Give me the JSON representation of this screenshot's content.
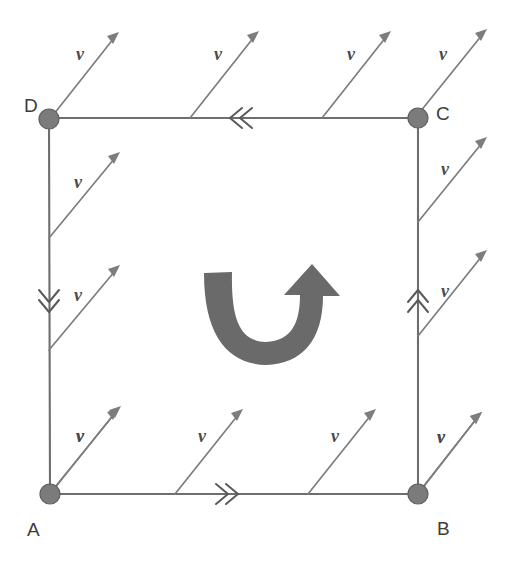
{
  "figure": {
    "shape": "square-loop",
    "background_color": "#ffffff",
    "line_color": "#6e6e6e",
    "vector_color": "#7d7d7d",
    "node_color": "#7b7b7b",
    "curved_arrow_color": "#6a6a6a",
    "label_color": "#3c3c3c"
  },
  "nodes": [
    {
      "id": "D",
      "label": "D",
      "x": 49,
      "y": 119,
      "label_x": 24,
      "label_y": 105,
      "radius": 10
    },
    {
      "id": "C",
      "label": "C",
      "x": 418,
      "y": 118,
      "label_x": 436,
      "label_y": 113,
      "radius": 10
    },
    {
      "id": "A",
      "label": "A",
      "x": 50,
      "y": 494,
      "label_x": 27,
      "label_y": 534,
      "radius": 10
    },
    {
      "id": "B",
      "label": "B",
      "x": 418,
      "y": 494,
      "label_x": 437,
      "label_y": 534,
      "radius": 10
    }
  ],
  "edges": [
    {
      "id": "edge-DC",
      "from": "D",
      "to": "C",
      "side": "top",
      "direction": "right-to-left",
      "marker": "double-chevron-left",
      "marker_x": 232,
      "marker_y": 118
    },
    {
      "id": "edge-AD",
      "from": "D",
      "to": "A",
      "side": "left",
      "direction": "top-to-bottom",
      "marker": "double-chevron-down",
      "marker_x": 49,
      "marker_y": 300
    },
    {
      "id": "edge-BC",
      "from": "B",
      "to": "C",
      "side": "right",
      "direction": "bottom-to-top",
      "marker": "double-chevron-up",
      "marker_x": 418,
      "marker_y": 300
    },
    {
      "id": "edge-AB",
      "from": "A",
      "to": "B",
      "side": "bottom",
      "direction": "left-to-right",
      "marker": "double-chevron-right",
      "marker_x": 226,
      "marker_y": 494
    }
  ],
  "circulation": {
    "order": "A-B-C-D-A",
    "sense": "counterclockwise"
  },
  "vectors": {
    "symbol": "v",
    "count": 14,
    "angle_degrees": 50,
    "description": "uniform velocity vectors all pointing up and to the right",
    "items": [
      {
        "id": "v-top-1",
        "edge": "top",
        "x1": 50,
        "y1": 119,
        "x2": 119,
        "y2": 32,
        "label": "v",
        "lx": 76,
        "ly": 60
      },
      {
        "id": "v-top-2",
        "edge": "top",
        "x1": 190,
        "y1": 118,
        "x2": 259,
        "y2": 31,
        "label": "v",
        "lx": 214,
        "ly": 60
      },
      {
        "id": "v-top-3",
        "edge": "top",
        "x1": 322,
        "y1": 118,
        "x2": 391,
        "y2": 31,
        "label": "v",
        "lx": 347,
        "ly": 60
      },
      {
        "id": "v-top-4",
        "edge": "top",
        "x1": 420,
        "y1": 112,
        "x2": 487,
        "y2": 29,
        "label": "v",
        "lx": 439,
        "ly": 60
      },
      {
        "id": "v-left-1",
        "edge": "left",
        "x1": 49,
        "y1": 238,
        "x2": 120,
        "y2": 152,
        "label": "v",
        "lx": 74,
        "ly": 183
      },
      {
        "id": "v-left-2",
        "edge": "left",
        "x1": 49,
        "y1": 350,
        "x2": 120,
        "y2": 265,
        "label": "v",
        "lx": 74,
        "ly": 296
      },
      {
        "id": "v-left-3",
        "edge": "left",
        "x1": 51,
        "y1": 492,
        "x2": 121,
        "y2": 406,
        "label": "v",
        "lx": 76,
        "ly": 437
      },
      {
        "id": "v-right-1",
        "edge": "right",
        "x1": 418,
        "y1": 222,
        "x2": 487,
        "y2": 137,
        "label": "v",
        "lx": 441,
        "ly": 170
      },
      {
        "id": "v-right-2",
        "edge": "right",
        "x1": 418,
        "y1": 336,
        "x2": 487,
        "y2": 250,
        "label": "v",
        "lx": 441,
        "ly": 292
      },
      {
        "id": "v-right-3",
        "edge": "right",
        "x1": 419,
        "y1": 492,
        "x2": 482,
        "y2": 412,
        "label": "v",
        "lx": 440,
        "ly": 438
      },
      {
        "id": "v-bottom-1",
        "edge": "bottom",
        "x1": 50,
        "y1": 494,
        "x2": 119,
        "y2": 408,
        "label": "v",
        "lx": 76,
        "ly": 437
      },
      {
        "id": "v-bottom-2",
        "edge": "bottom",
        "x1": 175,
        "y1": 494,
        "x2": 243,
        "y2": 409,
        "label": "v",
        "lx": 198,
        "ly": 437
      },
      {
        "id": "v-bottom-3",
        "edge": "bottom",
        "x1": 308,
        "y1": 494,
        "x2": 376,
        "y2": 409,
        "label": "v",
        "lx": 331,
        "ly": 437
      },
      {
        "id": "v-bottom-4",
        "edge": "bottom",
        "x1": 418,
        "y1": 494,
        "x2": 482,
        "y2": 412,
        "label": "v",
        "lx": 438,
        "ly": 438
      }
    ]
  },
  "curved_arrow": {
    "id": "rotation-arrow",
    "shape": "u-turn-upward",
    "head_side": "right",
    "head_direction": "up",
    "center_x": 263,
    "center_y": 312
  }
}
